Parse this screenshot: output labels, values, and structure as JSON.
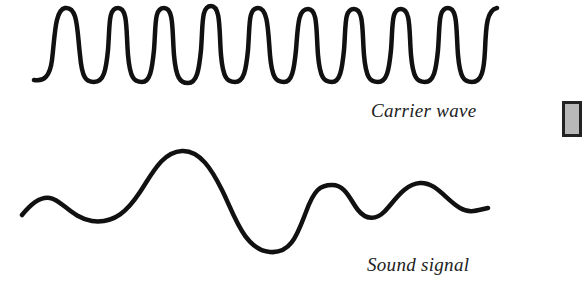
{
  "diagram": {
    "carrier_wave": {
      "label": "Carrier wave",
      "description": "High-frequency regular oscillation",
      "peak_count": 10,
      "stroke_color": "#111111"
    },
    "sound_signal": {
      "label": "Sound signal",
      "description": "Low-frequency irregular waveform",
      "stroke_color": "#111111"
    },
    "edge_element": {
      "fill": "#b8b8b8",
      "border": "#222222"
    }
  }
}
